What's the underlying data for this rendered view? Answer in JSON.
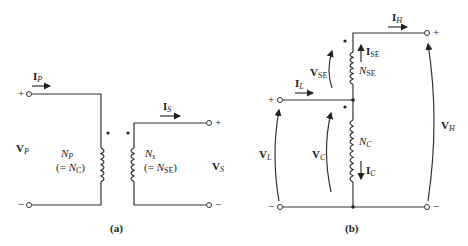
{
  "diagram_a": {
    "caption": "(a)",
    "primary": {
      "current": {
        "main": "I",
        "sub": "P"
      },
      "voltage": {
        "main": "V",
        "sub": "P"
      },
      "turns": {
        "main": "N",
        "sub": "P"
      },
      "turns_equiv": {
        "prefix": "(= ",
        "main": "N",
        "sub": "C",
        "suffix": ")"
      },
      "plus": "+",
      "minus": "−"
    },
    "secondary": {
      "current": {
        "main": "I",
        "sub": "S"
      },
      "voltage": {
        "main": "V",
        "sub": "S"
      },
      "turns": {
        "main": "N",
        "sub": "s"
      },
      "turns_equiv": {
        "prefix": "(= ",
        "main": "N",
        "sub": "SE",
        "suffix": ")"
      },
      "plus": "+",
      "minus": "−"
    }
  },
  "diagram_b": {
    "caption": "(b)",
    "high_current": {
      "main": "I",
      "sub": "H"
    },
    "high_voltage": {
      "main": "V",
      "sub": "H"
    },
    "low_current": {
      "main": "I",
      "sub": "L"
    },
    "low_voltage": {
      "main": "V",
      "sub": "L"
    },
    "series_current": {
      "main": "I",
      "sub": "SE"
    },
    "series_voltage": {
      "main": "V",
      "sub": "SE"
    },
    "series_turns": {
      "main": "N",
      "sub": "SE"
    },
    "common_current": {
      "main": "I",
      "sub": "C"
    },
    "common_voltage": {
      "main": "V",
      "sub": "C"
    },
    "common_turns": {
      "main": "N",
      "sub": "C"
    },
    "plus": "+",
    "minus": "−"
  }
}
